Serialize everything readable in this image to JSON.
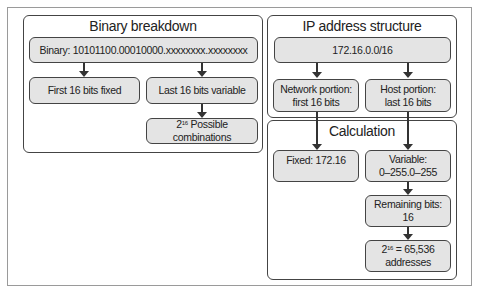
{
  "binary_panel": {
    "title": "Binary breakdown",
    "binary": "Binary: 10101100.00010000.xxxxxxxx.xxxxxxxx",
    "first": "First 16 bits fixed",
    "last": "Last 16 bits variable",
    "combos_base": "2",
    "combos_exp": "16",
    "combos_text": " Possible combinations"
  },
  "ip_panel": {
    "title": "IP address structure",
    "cidr": "172.16.0.0/16",
    "network_line1": "Network portion:",
    "network_line2": "first 16 bits",
    "host_line1": "Host portion:",
    "host_line2": "last 16 bits"
  },
  "calc_panel": {
    "title": "Calculation",
    "fixed": "Fixed: 172.16",
    "variable_line1": "Variable:",
    "variable_line2": "0–255.0–255",
    "remaining_line1": "Remaining bits:",
    "remaining_line2": "16",
    "total_base": "2",
    "total_exp": "16",
    "total_text": " = 65,536",
    "total_line2": "addresses"
  },
  "colors": {
    "node_fill": "#e4e4e4",
    "border": "#444444",
    "frame": "#9a9a9a"
  }
}
